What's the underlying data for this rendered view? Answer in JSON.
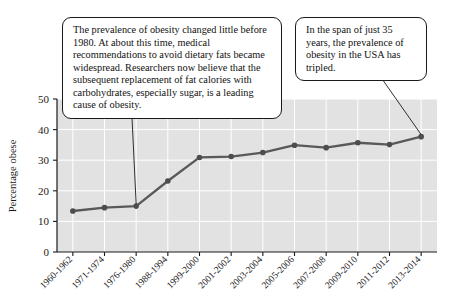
{
  "chart_data": {
    "type": "line",
    "title": "",
    "xlabel": "",
    "ylabel": "Percentage obese",
    "ylim": [
      0,
      50
    ],
    "yticks": [
      0,
      10,
      20,
      30,
      40,
      50
    ],
    "grid": true,
    "legend": "none",
    "categories": [
      "1960-1962",
      "1971-1974",
      "1976-1980",
      "1988-1994",
      "1999-2000",
      "2001-2002",
      "2003-2004",
      "2005-2006",
      "2007-2008",
      "2009-2010",
      "2011-2012",
      "2013-2014"
    ],
    "values": [
      13.4,
      14.5,
      15.0,
      23.2,
      30.9,
      31.2,
      32.5,
      34.9,
      34.1,
      35.7,
      35.1,
      37.7
    ],
    "series_name": "Percentage obese",
    "line_color": "#595959",
    "marker_color": "#4d4d4d",
    "plot_background": "#e2e2e2",
    "gridline_color": "#ffffff"
  },
  "annotations": {
    "callout_1": {
      "name": "obesity-history-callout",
      "text": "The prevalence of obesity changed little before 1980. At about this time, medical recommendations to avoid dietary fats became widespread. Researchers now believe that the subsequent replacement of fat calories with carbohydrates, especially sugar, is a leading cause of obesity.",
      "points_to_category": "1976-1980"
    },
    "callout_2": {
      "name": "tripled-callout",
      "text": "In the span of just 35 years, the prevalence of obesity in the USA has tripled.",
      "points_to_category": "2013-2014"
    }
  },
  "axes": {
    "y_tick_labels": [
      "0",
      "10",
      "20",
      "30",
      "40",
      "50"
    ],
    "y_axis_title": "Percentage obese"
  }
}
